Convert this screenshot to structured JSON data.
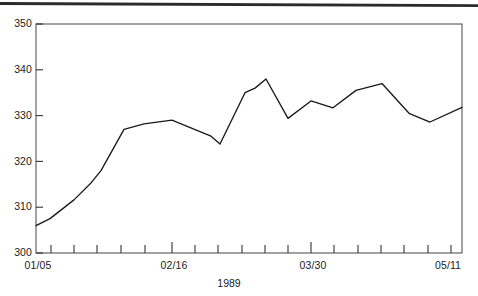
{
  "chart_data": {
    "type": "line",
    "title": "",
    "subtitle": "",
    "xlabel": "1989",
    "ylabel": "",
    "ylim": [
      300,
      350
    ],
    "xlim": [
      "01/05",
      "05/11"
    ],
    "grid": false,
    "legend": null,
    "yticks": [
      300,
      310,
      320,
      330,
      340,
      350
    ],
    "ytick_labels": [
      "300",
      "310",
      "320",
      "330",
      "340",
      "350"
    ],
    "xtick_labels": [
      "01/05",
      "02/16",
      "03/30",
      "05/11"
    ],
    "x_minor_tick_count": 19,
    "x": [
      "01/05",
      "01/12",
      "01/19",
      "01/26",
      "02/02",
      "02/09",
      "02/16",
      "02/23",
      "03/02",
      "03/09",
      "03/16",
      "03/23",
      "03/30",
      "04/06",
      "04/13",
      "04/20",
      "04/27",
      "05/04",
      "05/11"
    ],
    "values": [
      306.0,
      307.5,
      311.6,
      315.3,
      318.0,
      327.0,
      328.2,
      329.0,
      326.3,
      324.8,
      323.8,
      335.0,
      337.0,
      338.0,
      329.4,
      333.2,
      331.7,
      335.0,
      337.0
    ],
    "series": [
      {
        "name": "series-1",
        "color": "#1a1a1a",
        "values": [
          306.0,
          307.5,
          311.6,
          315.3,
          318.0,
          327.0,
          328.2,
          329.0,
          326.3,
          324.8,
          323.8,
          335.0,
          337.0,
          338.0,
          329.4,
          333.2,
          331.7,
          335.0,
          337.0
        ]
      }
    ],
    "points": [
      {
        "x": 36,
        "value": 306.0
      },
      {
        "x": 50,
        "value": 307.5
      },
      {
        "x": 74,
        "value": 311.6
      },
      {
        "x": 91,
        "value": 315.3
      },
      {
        "x": 101,
        "value": 318.0
      },
      {
        "x": 124,
        "value": 327.0
      },
      {
        "x": 144,
        "value": 328.2
      },
      {
        "x": 172,
        "value": 329.0
      },
      {
        "x": 189,
        "value": 327.5
      },
      {
        "x": 211,
        "value": 325.5
      },
      {
        "x": 220,
        "value": 323.8
      },
      {
        "x": 245,
        "value": 335.0
      },
      {
        "x": 255,
        "value": 336.0
      },
      {
        "x": 266,
        "value": 338.0
      },
      {
        "x": 288,
        "value": 329.4
      },
      {
        "x": 311,
        "value": 333.2
      },
      {
        "x": 333,
        "value": 331.7
      },
      {
        "x": 356,
        "value": 335.5
      },
      {
        "x": 382,
        "value": 337.0
      },
      {
        "x": 409,
        "value": 330.5
      },
      {
        "x": 430,
        "value": 328.6
      },
      {
        "x": 462,
        "value": 331.8
      }
    ]
  },
  "axes": {
    "y_ticks": [
      {
        "label": "350",
        "value": 350
      },
      {
        "label": "340",
        "value": 340
      },
      {
        "label": "330",
        "value": 330
      },
      {
        "label": "320",
        "value": 320
      },
      {
        "label": "310",
        "value": 310
      },
      {
        "label": "300",
        "value": 300
      }
    ],
    "x_ticks": [
      {
        "label": "01/05",
        "x": 36,
        "major": true
      },
      {
        "label": "",
        "x": 51,
        "major": false
      },
      {
        "label": "",
        "x": 74,
        "major": false
      },
      {
        "label": "",
        "x": 97,
        "major": false
      },
      {
        "label": "",
        "x": 121,
        "major": false
      },
      {
        "label": "",
        "x": 145,
        "major": false
      },
      {
        "label": "02/16",
        "x": 172,
        "major": true
      },
      {
        "label": "",
        "x": 195,
        "major": false
      },
      {
        "label": "",
        "x": 218,
        "major": false
      },
      {
        "label": "",
        "x": 242,
        "major": false
      },
      {
        "label": "",
        "x": 265,
        "major": false
      },
      {
        "label": "",
        "x": 288,
        "major": false
      },
      {
        "label": "03/30",
        "x": 311,
        "major": true
      },
      {
        "label": "",
        "x": 334,
        "major": false
      },
      {
        "label": "",
        "x": 358,
        "major": false
      },
      {
        "label": "",
        "x": 381,
        "major": false
      },
      {
        "label": "",
        "x": 404,
        "major": false
      },
      {
        "label": "",
        "x": 428,
        "major": false
      },
      {
        "label": "",
        "x": 451,
        "major": false
      },
      {
        "label": "05/11",
        "x": 462,
        "major": true
      }
    ],
    "xlabel": "1989"
  },
  "colors": {
    "line": "#1a1a1a",
    "frame": "#555555",
    "text": "#222222",
    "rule": "#2b2b2b",
    "background": "#ffffff"
  }
}
